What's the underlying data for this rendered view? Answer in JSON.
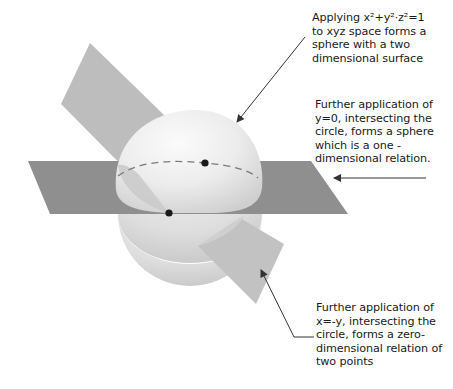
{
  "annotations": {
    "sphere": {
      "text": "Applying x²+y²·z²=1\nto xyz space forms a\nsphere with a two\ndimensional surface"
    },
    "circle": {
      "text": "Further application of\ny=0, intersecting the\ncircle, forms a sphere\nwhich is a one -\ndimensional relation."
    },
    "points": {
      "text": "Further application of\nx=-y, intersecting the\ncircle, forms a zero-\ndimensional relation of\ntwo points"
    }
  },
  "colors": {
    "horizontal_plane": "#8f8f8f",
    "diagonal_plane": "#bdbdbd",
    "sphere_light": "#f7f7f7",
    "sphere_shadow": "#d4d4d4",
    "arrow": "#333333",
    "point": "#1a1a1a"
  }
}
